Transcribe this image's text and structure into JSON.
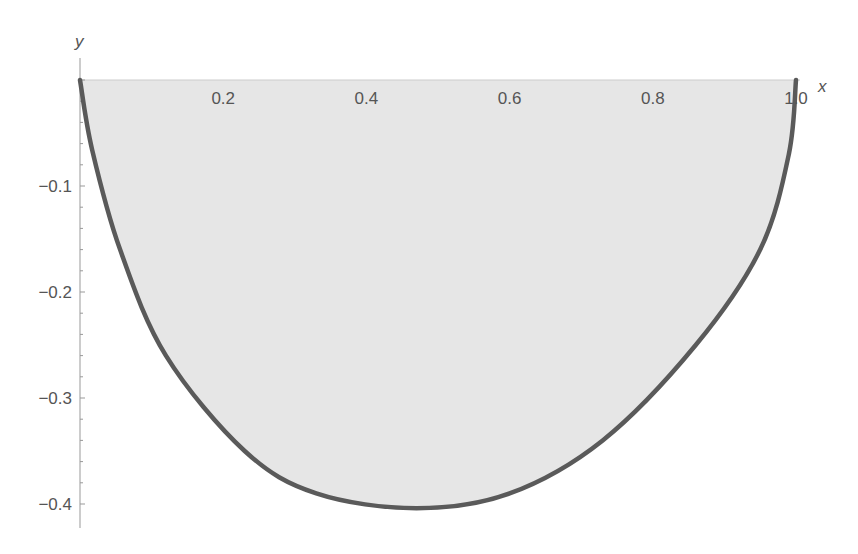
{
  "chart_data": {
    "type": "area",
    "title": "",
    "xlabel": "x",
    "ylabel": "y",
    "xlim": [
      0,
      1.0
    ],
    "ylim": [
      -0.42,
      0
    ],
    "x_ticks": [
      "0.2",
      "0.4",
      "0.6",
      "0.8",
      "1.0"
    ],
    "y_ticks": [
      "-0.1",
      "-0.2",
      "-0.3",
      "-0.4"
    ],
    "grid": false,
    "legend": null,
    "note": "Points are estimated from pixel positions; curve identity not confirmed.",
    "series": [
      {
        "name": "curve",
        "fill": "region between curve and y=0",
        "x": [
          0.0,
          0.017,
          0.056,
          0.12,
          0.23,
          0.33,
          0.47,
          0.6,
          0.73,
          0.86,
          0.95,
          0.99,
          1.0
        ],
        "y": [
          0.0,
          -0.066,
          -0.16,
          -0.26,
          -0.35,
          -0.39,
          -0.404,
          -0.39,
          -0.34,
          -0.25,
          -0.16,
          -0.07,
          0.0
        ]
      }
    ]
  },
  "colors": {
    "curve": "#5a5a5a",
    "fill": "#e6e6e6",
    "axis": "#999999",
    "text": "#555555"
  }
}
